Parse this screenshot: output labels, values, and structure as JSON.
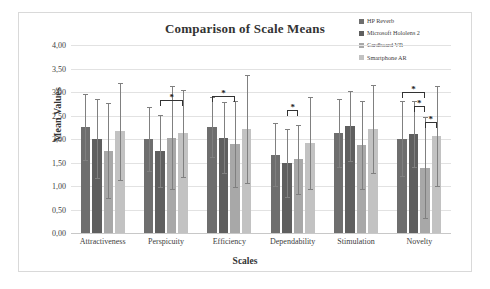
{
  "chart_data": {
    "type": "bar",
    "title": "Comparison of Scale Means",
    "xlabel": "Scales",
    "ylabel": "Mean Values",
    "ylim": [
      0,
      4
    ],
    "ytick_step": 0.5,
    "ytick_labels": [
      "4,00",
      "3,50",
      "3,00",
      "2,50",
      "2,00",
      "1,50",
      "1,00",
      "0,50",
      "0,00"
    ],
    "ytick_values": [
      4.0,
      3.5,
      3.0,
      2.5,
      2.0,
      1.5,
      1.0,
      0.5,
      0.0
    ],
    "grid": true,
    "legend_position": "top-right",
    "decimal_separator": ",",
    "categories": [
      "Attractiveness",
      "Perspicuity",
      "Efficiency",
      "Dependability",
      "Stimulation",
      "Novelty"
    ],
    "series": [
      {
        "name": "HP Reverb",
        "color": "#6e6e6e",
        "values": [
          2.25,
          2.0,
          2.26,
          1.66,
          2.13,
          2.01
        ],
        "err_low": [
          1.55,
          1.32,
          1.62,
          0.99,
          1.41,
          1.22
        ],
        "err_high": [
          2.95,
          2.68,
          2.9,
          2.33,
          2.85,
          2.8
        ]
      },
      {
        "name": "Microsoft Hololens 2",
        "color": "#5f5f5f",
        "values": [
          2.01,
          1.74,
          2.03,
          1.49,
          2.28,
          2.11
        ],
        "err_low": [
          1.17,
          0.97,
          1.28,
          0.77,
          1.53,
          1.41
        ],
        "err_high": [
          2.85,
          2.51,
          2.78,
          2.21,
          3.03,
          2.81
        ]
      },
      {
        "name": "Cardboard VR",
        "color": "#a8a8a8",
        "values": [
          1.75,
          2.03,
          1.89,
          1.57,
          1.87,
          1.39
        ],
        "err_low": [
          0.74,
          0.94,
          0.98,
          0.84,
          0.94,
          0.32
        ],
        "err_high": [
          2.76,
          3.12,
          2.8,
          2.3,
          2.8,
          2.46
        ]
      },
      {
        "name": "Smartphone AR",
        "color": "#c2c2c2",
        "values": [
          2.16,
          2.12,
          2.22,
          1.92,
          2.21,
          2.06
        ],
        "err_low": [
          1.13,
          1.2,
          1.07,
          0.94,
          1.27,
          0.99
        ],
        "err_high": [
          3.19,
          3.05,
          3.37,
          2.9,
          3.15,
          3.13
        ]
      }
    ],
    "significance_marks": [
      {
        "category": "Perspicuity",
        "from_series": 1,
        "to_series": 3,
        "label": "*",
        "top_value": 2.83
      },
      {
        "category": "Efficiency",
        "from_series": 0,
        "to_series": 2,
        "label": "*",
        "top_value": 2.92
      },
      {
        "category": "Dependability",
        "from_series": 1,
        "to_series": 2,
        "label": "*",
        "top_value": 2.62
      },
      {
        "category": "Novelty",
        "from_series": 0,
        "to_series": 2,
        "label": "*",
        "top_value": 3.01
      },
      {
        "category": "Novelty",
        "from_series": 1,
        "to_series": 2,
        "label": "*",
        "top_value": 2.7
      },
      {
        "category": "Novelty",
        "from_series": 2,
        "to_series": 3,
        "label": "*",
        "top_value": 2.36
      }
    ]
  }
}
